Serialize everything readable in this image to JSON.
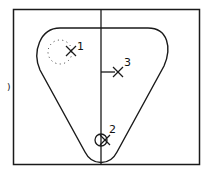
{
  "diagram": {
    "colors": {
      "stroke": "#1a1a1a",
      "background": "#ffffff"
    },
    "points": [
      {
        "id": "1",
        "label": "1",
        "marker": "x-marker",
        "note": "with dotted circle"
      },
      {
        "id": "2",
        "label": "2",
        "marker": "x-marker",
        "note": "with solid circle"
      },
      {
        "id": "3",
        "label": "3",
        "marker": "x-marker",
        "note": "with horizontal tick"
      }
    ],
    "edge_glyph": ")"
  }
}
